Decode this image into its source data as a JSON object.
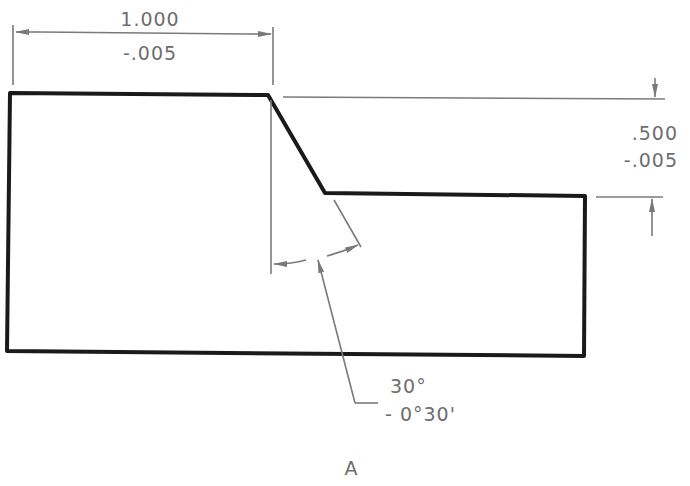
{
  "drawing": {
    "view_label": "A",
    "colors": {
      "outline": "#1a1a1a",
      "dimension": "#7a7a7a",
      "text": "#6e6e6e",
      "background": "#ffffff"
    },
    "dimensions": {
      "width": {
        "nominal": "1.000",
        "tolerance": "-.005"
      },
      "step_height": {
        "nominal": ".500",
        "tolerance": "-.005"
      },
      "chamfer_angle": {
        "nominal": "30°",
        "tolerance": "- 0°30'"
      }
    }
  }
}
